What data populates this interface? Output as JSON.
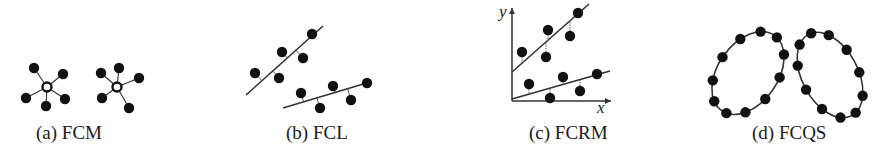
{
  "panels": [
    {
      "id": "a",
      "caption": "(a) FCM",
      "type": "point-prototype clusters"
    },
    {
      "id": "b",
      "caption": "(b) FCL",
      "type": "line prototype clusters"
    },
    {
      "id": "c",
      "caption": "(c) FCRM",
      "type": "regression line clusters",
      "axes": {
        "x": "x",
        "y": "y"
      }
    },
    {
      "id": "d",
      "caption": "(d) FCQS",
      "type": "quadric shell clusters"
    }
  ],
  "colors": {
    "point": "#111111",
    "line": "#333333",
    "center_fill": "#ffffff"
  },
  "geometry": {
    "fcm": {
      "clusters": [
        {
          "center": [
            47,
            87
          ],
          "points": [
            [
              34,
              68
            ],
            [
              63,
              74
            ],
            [
              26,
              98
            ],
            [
              46,
              106
            ],
            [
              65,
              99
            ]
          ]
        },
        {
          "center": [
            117,
            87
          ],
          "points": [
            [
              101,
              73
            ],
            [
              119,
              68
            ],
            [
              139,
              78
            ],
            [
              102,
              98
            ],
            [
              129,
              108
            ]
          ]
        }
      ]
    },
    "fcl": {
      "lines": [
        {
          "from": [
            246,
            95
          ],
          "to": [
            323,
            26
          ],
          "points": [
            [
              312,
              34
            ],
            [
              282,
              52
            ],
            [
              303,
              58
            ],
            [
              255,
              73
            ],
            [
              279,
              78
            ]
          ]
        },
        {
          "from": [
            283,
            108
          ],
          "to": [
            370,
            82
          ],
          "points": [
            [
              301,
              93
            ],
            [
              333,
              86
            ],
            [
              367,
              83
            ],
            [
              320,
              108
            ],
            [
              351,
              100
            ]
          ]
        }
      ]
    },
    "fcrm": {
      "origin": [
        512,
        101
      ],
      "y_top": 8,
      "x_right": 611,
      "lines": [
        {
          "from": [
            512,
            72
          ],
          "to": [
            589,
            4
          ],
          "points": [
            [
              578,
              13
            ],
            [
              548,
              30
            ],
            [
              570,
              36
            ],
            [
              522,
              52
            ],
            [
              546,
              57
            ]
          ]
        },
        {
          "from": [
            512,
            99
          ],
          "to": [
            610,
            71
          ],
          "points": [
            [
              597,
              74
            ],
            [
              563,
              77
            ],
            [
              529,
              84
            ],
            [
              580,
              91
            ],
            [
              550,
              98
            ]
          ]
        }
      ]
    },
    "fcqs": {
      "ellipses": [
        {
          "cx": 748,
          "cy": 73,
          "rx": 30,
          "ry": 46,
          "rot": 35
        },
        {
          "cx": 830,
          "cy": 75,
          "rx": 28,
          "ry": 46,
          "rot": -28
        }
      ]
    }
  }
}
